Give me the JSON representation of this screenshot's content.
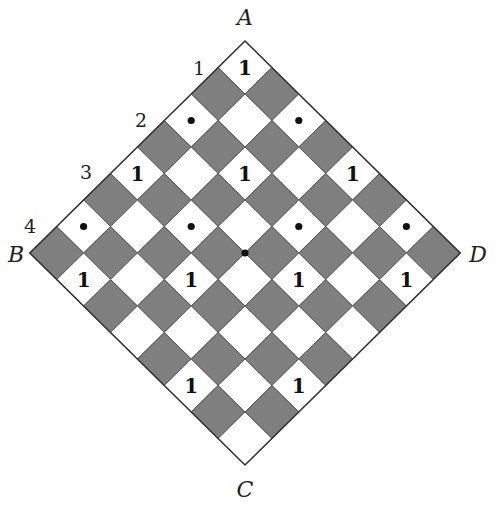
{
  "figure": {
    "type": "rotated-checkerboard",
    "board_size": 8,
    "colors": {
      "light": "#ffffff",
      "dark": "#7f7f7f",
      "grid_line": "#444444",
      "border": "#333333",
      "mark": "#111111"
    },
    "geometry": {
      "top_vertex": [
        245,
        41
      ],
      "half_w": 26.9,
      "half_h": 26.5
    },
    "corner_labels": [
      {
        "id": "A",
        "text": "A",
        "x": 245,
        "y": 25
      },
      {
        "id": "B",
        "text": "B",
        "x": 16,
        "y": 262
      },
      {
        "id": "D",
        "text": "D",
        "x": 478,
        "y": 262
      },
      {
        "id": "C",
        "text": "C",
        "x": 245,
        "y": 497
      }
    ],
    "edge_labels": [
      {
        "text": "1",
        "x": 199,
        "y": 75
      },
      {
        "text": "2",
        "x": 141,
        "y": 127
      },
      {
        "text": "3",
        "x": 86,
        "y": 179
      },
      {
        "text": "4",
        "x": 30,
        "y": 233
      }
    ],
    "marks": [
      {
        "row": 0,
        "col": 0,
        "type": "number",
        "text": "1"
      },
      {
        "row": 2,
        "col": 0,
        "type": "dot"
      },
      {
        "row": 0,
        "col": 2,
        "type": "dot"
      },
      {
        "row": 4,
        "col": 0,
        "type": "number",
        "text": "1"
      },
      {
        "row": 2,
        "col": 2,
        "type": "number",
        "text": "1"
      },
      {
        "row": 0,
        "col": 4,
        "type": "number",
        "text": "1"
      },
      {
        "row": 6,
        "col": 0,
        "type": "dot"
      },
      {
        "row": 4,
        "col": 2,
        "type": "dot"
      },
      {
        "row": 2,
        "col": 4,
        "type": "dot"
      },
      {
        "row": 0,
        "col": 6,
        "type": "dot"
      },
      {
        "row": 7,
        "col": 1,
        "type": "number",
        "text": "1"
      },
      {
        "row": 5,
        "col": 3,
        "type": "number",
        "text": "1"
      },
      {
        "row": 3,
        "col": 5,
        "type": "number",
        "text": "1"
      },
      {
        "row": 1,
        "col": 7,
        "type": "number",
        "text": "1"
      },
      {
        "row": 7,
        "col": 5,
        "type": "number",
        "text": "1"
      },
      {
        "row": 5,
        "col": 7,
        "type": "number",
        "text": "1"
      }
    ],
    "center_dot": {
      "x": 245,
      "y": 253
    }
  }
}
